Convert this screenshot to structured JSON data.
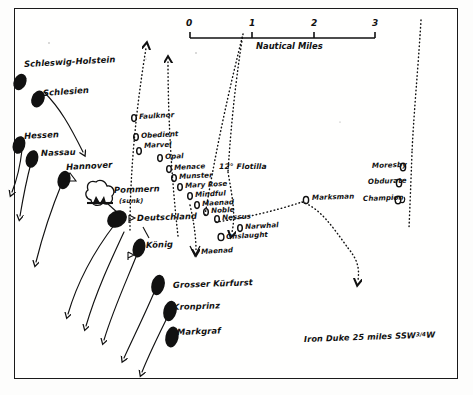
{
  "map": {
    "title": "Battle of Jutland - night action track chart",
    "background_color": "#fdfdfc",
    "ink_color": "#111111"
  },
  "scale_bar": {
    "caption": "Nautical Miles",
    "ticks": [
      "0",
      "1",
      "2",
      "3"
    ],
    "unit": "nautical miles",
    "length_miles": 3
  },
  "note": {
    "text": "Iron Duke 25 miles  SSW",
    "fraction": "3/4",
    "suffix": "W",
    "full": "Iron Duke 25 miles SSW 3/4 W"
  },
  "flotilla_label": {
    "text": "12° Flotilla"
  },
  "german_ships": [
    {
      "name": "Schleswig-Holstein",
      "x": 24,
      "y": 79
    },
    {
      "name": "Schlesien",
      "x": 43,
      "y": 97
    },
    {
      "name": "Hessen",
      "x": 24,
      "y": 143
    },
    {
      "name": "Nassau",
      "x": 40,
      "y": 156
    },
    {
      "name": "Hannover",
      "x": 66,
      "y": 172
    },
    {
      "name": "Pommern",
      "x": 113,
      "y": 192
    },
    {
      "name": "(sunk)",
      "x": 118,
      "y": 203
    },
    {
      "name": "Deutschland",
      "x": 135,
      "y": 220
    },
    {
      "name": "König",
      "x": 143,
      "y": 247
    },
    {
      "name": "Grosser Kürfurst",
      "x": 173,
      "y": 288
    },
    {
      "name": "Kronprinz",
      "x": 173,
      "y": 308
    },
    {
      "name": "Markgraf",
      "x": 176,
      "y": 332
    }
  ],
  "british_destroyers": [
    {
      "name": "Faulknor",
      "x": 140,
      "y": 117
    },
    {
      "name": "Obedient",
      "x": 142,
      "y": 136
    },
    {
      "name": "Marvel",
      "x": 145,
      "y": 147
    },
    {
      "name": "Opal",
      "x": 166,
      "y": 157
    },
    {
      "name": "Menace",
      "x": 175,
      "y": 168
    },
    {
      "name": "Munster",
      "x": 180,
      "y": 177
    },
    {
      "name": "Mary Rose",
      "x": 186,
      "y": 186
    },
    {
      "name": "Mindful",
      "x": 196,
      "y": 195
    },
    {
      "name": "Maenad",
      "x": 203,
      "y": 204
    },
    {
      "name": "Noble",
      "x": 212,
      "y": 211
    },
    {
      "name": "Nessus",
      "x": 223,
      "y": 218
    },
    {
      "name": "Narwhal",
      "x": 246,
      "y": 227
    },
    {
      "name": "Onslaught",
      "x": 227,
      "y": 236
    },
    {
      "name": "Maenad",
      "x": 200,
      "y": 254
    },
    {
      "name": "Marksman",
      "x": 312,
      "y": 199
    },
    {
      "name": "Moresby",
      "x": 409,
      "y": 166
    },
    {
      "name": "Obdurate",
      "x": 405,
      "y": 182
    },
    {
      "name": "Champion",
      "x": 404,
      "y": 199
    }
  ]
}
